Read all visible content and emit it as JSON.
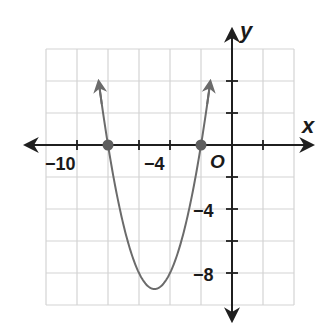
{
  "chart_data": {
    "type": "line",
    "title": "",
    "xlabel": "x",
    "ylabel": "y",
    "origin_label": "O",
    "xlim": [
      -12,
      4
    ],
    "ylim": [
      -10,
      6
    ],
    "grid": true,
    "grid_step": 2,
    "x_tick_labels": [
      {
        "value": -10,
        "label": "−10"
      },
      {
        "value": -4,
        "label": "−4"
      }
    ],
    "y_tick_labels": [
      {
        "value": -4,
        "label": "−4"
      },
      {
        "value": -8,
        "label": "−8"
      }
    ],
    "series": [
      {
        "name": "parabola",
        "equation": "y = (x + 8)(x + 2)",
        "vertex": [
          -5,
          -9
        ],
        "x_intercepts": [
          -8,
          -2
        ],
        "points": [
          [
            -8.55,
            5.7
          ],
          [
            -8,
            0
          ],
          [
            -7,
            -5
          ],
          [
            -6,
            -8
          ],
          [
            -5,
            -9
          ],
          [
            -4,
            -8
          ],
          [
            -3,
            -5
          ],
          [
            -2,
            0
          ],
          [
            -1.45,
            5.7
          ]
        ],
        "color": "#6b6b6b",
        "arrows_at_ends": true
      }
    ],
    "marked_points": [
      {
        "x": -8,
        "y": 0,
        "color": "#5e5e5e"
      },
      {
        "x": -2,
        "y": 0,
        "color": "#5e5e5e"
      }
    ]
  },
  "labels": {
    "x_axis": "x",
    "y_axis": "y",
    "origin": "O",
    "x_tick_neg10": "−10",
    "x_tick_neg4": "−4",
    "y_tick_neg4": "−4",
    "y_tick_neg8": "−8"
  },
  "colors": {
    "grid": "#d4d4d4",
    "axis": "#1f1f1f",
    "curve": "#6b6b6b",
    "point": "#5e5e5e"
  }
}
